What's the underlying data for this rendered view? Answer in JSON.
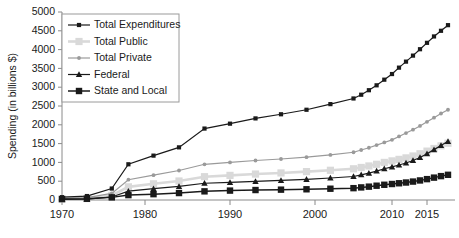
{
  "chart_data": {
    "type": "line",
    "title": "",
    "xlabel": "",
    "ylabel": "Spending (in billions $)",
    "ylim": [
      0,
      5000
    ],
    "ytick_values": [
      0,
      500,
      1000,
      1500,
      2000,
      2500,
      3000,
      3500,
      4000,
      4500,
      5000
    ],
    "ytick_labels": [
      "0",
      "500",
      "1000",
      "1500",
      "2000",
      "2500",
      "3000",
      "3500",
      "4000",
      "4500",
      "5000"
    ],
    "xtick_values": [
      1970,
      1980,
      1990,
      2000,
      2010,
      2015
    ],
    "xtick_labels": [
      "1970",
      "1980",
      "1990",
      "2000",
      "2010",
      "2015"
    ],
    "xlim": [
      1970,
      2018
    ],
    "grid": false,
    "legend_position": "upper-left-inside",
    "x": [
      1970,
      1973,
      1976,
      1978,
      1981,
      1984,
      1987,
      1990,
      1993,
      1996,
      1999,
      2002,
      2005,
      2006,
      2007,
      2008,
      2009,
      2010,
      2011,
      2012,
      2013,
      2014,
      2015,
      2016,
      2017,
      2018
    ],
    "series": [
      {
        "name": "Total Expenditures",
        "marker": "square-small",
        "color": "#1a1a1a",
        "values": [
          75,
          105,
          305,
          950,
          1180,
          1400,
          1900,
          2030,
          2170,
          2280,
          2400,
          2550,
          2700,
          2800,
          2920,
          3050,
          3200,
          3350,
          3520,
          3680,
          3840,
          4010,
          4180,
          4350,
          4500,
          4650
        ]
      },
      {
        "name": "Total Public",
        "marker": "square-large",
        "color": "#d9d9d9",
        "values": [
          27,
          38,
          120,
          350,
          430,
          505,
          620,
          655,
          690,
          720,
          755,
          790,
          830,
          865,
          905,
          950,
          1000,
          1040,
          1080,
          1120,
          1170,
          1230,
          1300,
          1370,
          1440,
          1510
        ]
      },
      {
        "name": "Total Private",
        "marker": "dot",
        "color": "#9a9a9a",
        "values": [
          45,
          62,
          175,
          540,
          660,
          785,
          950,
          1000,
          1050,
          1090,
          1140,
          1200,
          1270,
          1330,
          1390,
          1460,
          1530,
          1600,
          1690,
          1780,
          1870,
          1970,
          2080,
          2190,
          2300,
          2400
        ]
      },
      {
        "name": "Federal",
        "marker": "triangle",
        "color": "#1a1a1a",
        "values": [
          17,
          25,
          80,
          235,
          300,
          360,
          445,
          470,
          495,
          520,
          550,
          585,
          625,
          670,
          715,
          770,
          830,
          880,
          930,
          985,
          1050,
          1130,
          1230,
          1340,
          1450,
          1560
        ]
      },
      {
        "name": "State and Local",
        "marker": "square-bold",
        "color": "#1a1a1a",
        "values": [
          24,
          33,
          70,
          130,
          155,
          185,
          230,
          250,
          265,
          275,
          285,
          300,
          315,
          335,
          355,
          380,
          405,
          425,
          445,
          465,
          490,
          520,
          555,
          595,
          635,
          670
        ]
      }
    ]
  },
  "axis": {
    "y_title": "Spending (in billions $)"
  },
  "legend": {
    "entries": [
      {
        "label": "Total Expenditures"
      },
      {
        "label": "Total Public"
      },
      {
        "label": "Total Private"
      },
      {
        "label": "Federal"
      },
      {
        "label": "State and Local"
      }
    ]
  }
}
